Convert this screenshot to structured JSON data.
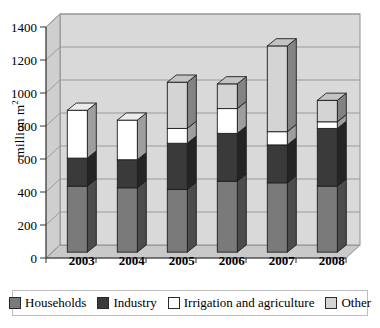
{
  "chart_data": {
    "type": "bar",
    "subtype": "stacked-column-3d",
    "title": "",
    "xlabel": "",
    "ylabel": "million m²",
    "ylim": [
      0,
      1400
    ],
    "ytick_step": 200,
    "yticks": [
      "0",
      "200",
      "400",
      "600",
      "800",
      "1000",
      "1200",
      "1400"
    ],
    "grid": true,
    "legend_position": "bottom",
    "categories": [
      "2003",
      "2004",
      "2005",
      "2006",
      "2007",
      "2008"
    ],
    "series": [
      {
        "name": "Households",
        "color": "#7a7a7a",
        "values": [
          400,
          390,
          380,
          430,
          420,
          400
        ]
      },
      {
        "name": "Industry",
        "color": "#3a3a3a",
        "values": [
          170,
          170,
          280,
          290,
          230,
          350
        ]
      },
      {
        "name": "Irrigation and agriculture",
        "color": "#ffffff",
        "values": [
          290,
          240,
          90,
          150,
          80,
          40
        ]
      },
      {
        "name": "Other",
        "color": "#d4d4d4",
        "values": [
          0,
          0,
          280,
          150,
          520,
          130
        ]
      }
    ],
    "totals": [
      860,
      800,
      1030,
      1020,
      1250,
      920
    ]
  },
  "legend": {
    "items": [
      {
        "label": "Households",
        "swatch": "#7a7a7a"
      },
      {
        "label": "Industry",
        "swatch": "#3a3a3a"
      },
      {
        "label": "Irrigation and agriculture",
        "swatch": "#ffffff"
      },
      {
        "label": "Other",
        "swatch": "#d4d4d4"
      }
    ]
  },
  "axis": {
    "y_title_main": "million m",
    "y_title_sup": "2"
  }
}
